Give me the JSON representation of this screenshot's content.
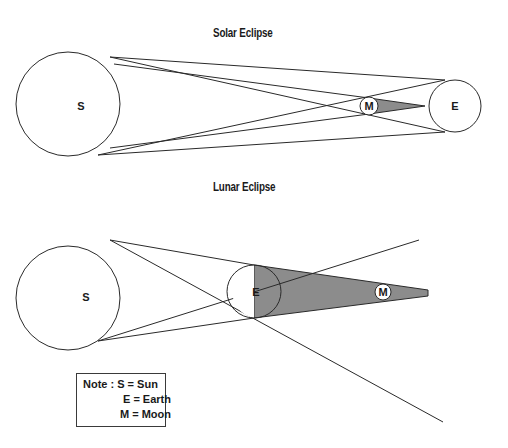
{
  "solar": {
    "title": "Solar Eclipse",
    "sun_label": "S",
    "moon_label": "M",
    "earth_label": "E"
  },
  "lunar": {
    "title": "Lunar Eclipse",
    "sun_label": "S",
    "earth_label": "E",
    "moon_label": "M"
  },
  "note": {
    "line1": "Note : S = Sun",
    "line2": "E = Earth",
    "line3": "M = Moon"
  },
  "colors": {
    "stroke": "#2a2a2a",
    "shadow": "#8c8c8c",
    "background": "#ffffff"
  }
}
